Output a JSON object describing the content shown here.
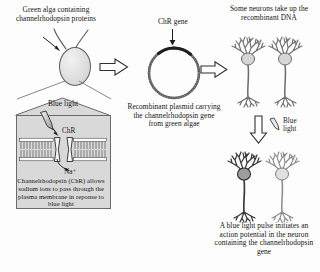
{
  "figure": {
    "background_color": "#fdfdfd",
    "ink_color": "#141414"
  },
  "panels": {
    "alga": {
      "caption": "Green alga containing channelrhodopsin proteins",
      "cell_name": "green-alga-cell",
      "flagella_count": 2,
      "cell_fill": "#e2e2e2",
      "cell_stroke": "#5d5d5d"
    },
    "membrane_detail": {
      "blue_light_label": "Blue light",
      "channel_label": "ChR",
      "ion_label": "Na⁺",
      "caption": "Channelrhodopsin (ChR) allows sodium ions to pass through the plasma membrane in reponse to blue light",
      "box_fill": "#d9d9d9",
      "box_stroke": "#6a6a6a",
      "bilayer_head_count": 22
    },
    "plasmid": {
      "gene_label": "ChR gene",
      "caption": "Recombinant plasmid carrying the channelrhodopsin gene from green algae",
      "ring_stroke": "#4a4a4a",
      "gene_segment_color": "#1f1f1f"
    },
    "neuron_uptake": {
      "caption": "Some neurons take up the recombinant DNA",
      "neuron_count": 2,
      "neuron_color": "#6e6e6e",
      "soma_fill": "#d6d6d6"
    },
    "light_stimulus": {
      "label_line1": "Blue",
      "label_line2": "light",
      "arrow_direction": "down"
    },
    "action_potential": {
      "caption": "A blue light pulse initiates an action potential in the neuron containing the channelrhodopsin gene",
      "neuron_count": 2,
      "activated_index": 0,
      "activated_color": "#3a3a3a",
      "resting_color": "#8a8a8a"
    }
  },
  "arrows": {
    "alga_to_plasmid": "block-arrow-right",
    "plasmid_to_neuron": "block-arrow-right",
    "light_down": "block-arrow-down"
  }
}
